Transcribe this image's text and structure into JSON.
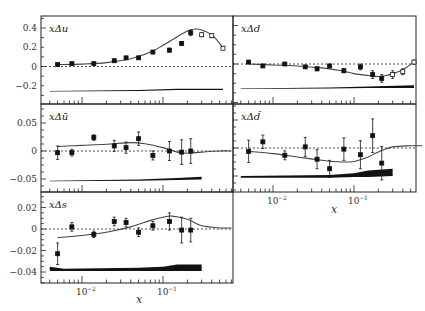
{
  "figure": {
    "xlabel": "x",
    "xtick_labels": [
      "10^-2",
      "10^-1"
    ]
  },
  "chart_data": [
    {
      "type": "scatter",
      "panel": "top-left",
      "title": "xΔu",
      "xlabel": "",
      "ylabel": "",
      "xscale": "log",
      "xlim": [
        0.004,
        0.7
      ],
      "ylim": [
        -0.3,
        0.5
      ],
      "yticks": [
        -0.2,
        0,
        0.2,
        0.4
      ],
      "ytick_labels": [
        "−0.2",
        "0",
        "0.2",
        "0.4"
      ],
      "points_filled": {
        "x": [
          0.005,
          0.0075,
          0.014,
          0.025,
          0.035,
          0.05,
          0.075,
          0.12,
          0.17,
          0.22
        ],
        "y": [
          0.02,
          0.03,
          0.03,
          0.06,
          0.09,
          0.09,
          0.15,
          0.17,
          0.24,
          0.35
        ],
        "err": [
          0.01,
          0.01,
          0.01,
          0.01,
          0.01,
          0.01,
          0.01,
          0.02,
          0.02,
          0.03
        ]
      },
      "points_open": {
        "x": [
          0.3,
          0.4,
          0.55
        ],
        "y": [
          0.33,
          0.32,
          0.19
        ],
        "err": [
          0.02,
          0.02,
          0.01
        ]
      },
      "curve": {
        "x": [
          0.005,
          0.01,
          0.02,
          0.04,
          0.07,
          0.1,
          0.15,
          0.2,
          0.25,
          0.3,
          0.4,
          0.5,
          0.55
        ],
        "y": [
          0.02,
          0.025,
          0.04,
          0.08,
          0.15,
          0.22,
          0.31,
          0.37,
          0.39,
          0.38,
          0.33,
          0.24,
          0.19
        ]
      },
      "syst_band": {
        "x": [
          0.004,
          0.05,
          0.15,
          0.55
        ],
        "lower": [
          -0.26,
          -0.255,
          -0.245,
          -0.245
        ],
        "upper": [
          -0.255,
          -0.245,
          -0.23,
          -0.23
        ]
      }
    },
    {
      "type": "scatter",
      "panel": "top-right",
      "title": "xΔd",
      "xscale": "log",
      "xlim": [
        0.004,
        0.7
      ],
      "ylim": [
        -0.3,
        0.5
      ],
      "points_filled": {
        "x": [
          0.005,
          0.0075,
          0.014,
          0.025,
          0.035,
          0.05,
          0.075,
          0.12,
          0.17,
          0.22
        ],
        "y": [
          0.02,
          -0.02,
          0.0,
          -0.03,
          -0.05,
          -0.02,
          -0.07,
          -0.03,
          -0.11,
          -0.15
        ],
        "err": [
          0.01,
          0.01,
          0.01,
          0.01,
          0.02,
          0.01,
          0.02,
          0.03,
          0.04,
          0.04
        ]
      },
      "points_open": {
        "x": [
          0.3,
          0.4,
          0.55
        ],
        "y": [
          -0.11,
          -0.08,
          0.02
        ],
        "err": [
          0.04,
          0.03,
          0.02
        ]
      },
      "curve": {
        "x": [
          0.005,
          0.01,
          0.02,
          0.04,
          0.07,
          0.1,
          0.15,
          0.2,
          0.25,
          0.3,
          0.4,
          0.55
        ],
        "y": [
          0.0,
          -0.01,
          -0.02,
          -0.04,
          -0.07,
          -0.1,
          -0.12,
          -0.13,
          -0.12,
          -0.1,
          -0.06,
          0.02
        ]
      },
      "syst_band": {
        "x": [
          0.004,
          0.05,
          0.15,
          0.55
        ],
        "lower": [
          -0.26,
          -0.255,
          -0.25,
          -0.25
        ],
        "upper": [
          -0.255,
          -0.245,
          -0.235,
          -0.22
        ]
      }
    },
    {
      "type": "scatter",
      "panel": "middle-left",
      "title": "xΔū",
      "xscale": "log",
      "xlim": [
        0.004,
        0.7
      ],
      "ylim": [
        -0.07,
        0.09
      ],
      "yticks": [
        -0.05,
        0,
        0.05
      ],
      "ytick_labels": [
        "−0.05",
        "0",
        "0.05"
      ],
      "points_filled": {
        "x": [
          0.005,
          0.0075,
          0.014,
          0.025,
          0.035,
          0.05,
          0.075,
          0.12,
          0.17,
          0.22
        ],
        "y": [
          -0.003,
          -0.003,
          0.024,
          0.009,
          0.006,
          0.022,
          -0.008,
          0.0,
          -0.002,
          0.0
        ],
        "err": [
          0.012,
          0.006,
          0.005,
          0.01,
          0.01,
          0.012,
          0.008,
          0.017,
          0.022,
          0.022
        ]
      },
      "curve": {
        "x": [
          0.005,
          0.01,
          0.02,
          0.04,
          0.06,
          0.1,
          0.15,
          0.2,
          0.3,
          0.5,
          0.7
        ],
        "y": [
          0.008,
          0.01,
          0.012,
          0.015,
          0.013,
          0.006,
          -0.002,
          -0.004,
          -0.002,
          0.0,
          0.0
        ]
      },
      "syst_band": {
        "x": [
          0.004,
          0.05,
          0.15,
          0.3
        ],
        "lower": [
          -0.054,
          -0.053,
          -0.052,
          -0.051
        ],
        "upper": [
          -0.053,
          -0.051,
          -0.048,
          -0.046
        ]
      }
    },
    {
      "type": "scatter",
      "panel": "middle-right",
      "title": "xΔd̄",
      "xscale": "log",
      "xlim": [
        0.004,
        0.7
      ],
      "ylim": [
        -0.07,
        0.09
      ],
      "points_filled": {
        "x": [
          0.005,
          0.0075,
          0.014,
          0.025,
          0.035,
          0.05,
          0.075,
          0.12,
          0.17,
          0.22
        ],
        "y": [
          -0.006,
          0.011,
          -0.013,
          0.002,
          -0.02,
          -0.037,
          -0.002,
          -0.012,
          0.022,
          -0.027
        ],
        "err": [
          0.02,
          0.012,
          0.008,
          0.017,
          0.017,
          0.015,
          0.02,
          0.025,
          0.03,
          0.03
        ]
      },
      "curve": {
        "x": [
          0.005,
          0.01,
          0.02,
          0.04,
          0.07,
          0.1,
          0.15,
          0.2,
          0.3,
          0.5,
          0.7
        ],
        "y": [
          -0.006,
          -0.01,
          -0.016,
          -0.022,
          -0.025,
          -0.024,
          -0.016,
          -0.007,
          0.002,
          0.004,
          0.004
        ]
      },
      "syst_band": {
        "x": [
          0.004,
          0.05,
          0.1,
          0.15,
          0.3
        ],
        "lower": [
          -0.053,
          -0.053,
          -0.052,
          -0.052,
          -0.05
        ],
        "upper": [
          -0.05,
          -0.048,
          -0.045,
          -0.04,
          -0.037
        ]
      }
    },
    {
      "type": "scatter",
      "panel": "bottom-left",
      "title": "xΔs",
      "xlabel": "x",
      "xscale": "log",
      "xlim": [
        0.004,
        0.7
      ],
      "ylim": [
        -0.045,
        0.03
      ],
      "yticks": [
        -0.04,
        -0.02,
        0,
        0.02
      ],
      "ytick_labels": [
        "−0.04",
        "−0.02",
        "0",
        "0.02"
      ],
      "xticks": [
        0.01,
        0.1
      ],
      "points_filled": {
        "x": [
          0.005,
          0.0075,
          0.014,
          0.025,
          0.035,
          0.05,
          0.075,
          0.12,
          0.17,
          0.22
        ],
        "y": [
          -0.023,
          0.002,
          -0.005,
          0.007,
          0.006,
          -0.003,
          0.003,
          0.007,
          -0.001,
          -0.001
        ],
        "err": [
          0.01,
          0.004,
          0.003,
          0.004,
          0.004,
          0.004,
          0.004,
          0.008,
          0.012,
          0.011
        ]
      },
      "curve": {
        "x": [
          0.005,
          0.01,
          0.02,
          0.04,
          0.07,
          0.1,
          0.13,
          0.2,
          0.3,
          0.5,
          0.7
        ],
        "y": [
          -0.008,
          -0.006,
          -0.003,
          0.002,
          0.008,
          0.011,
          0.012,
          0.009,
          0.003,
          0.001,
          0.001
        ]
      },
      "syst_band": {
        "x": [
          0.004,
          0.006,
          0.05,
          0.1,
          0.15,
          0.3
        ],
        "lower": [
          -0.039,
          -0.039,
          -0.039,
          -0.039,
          -0.039,
          -0.039
        ],
        "upper": [
          -0.035,
          -0.037,
          -0.036,
          -0.035,
          -0.033,
          -0.033
        ]
      }
    }
  ]
}
